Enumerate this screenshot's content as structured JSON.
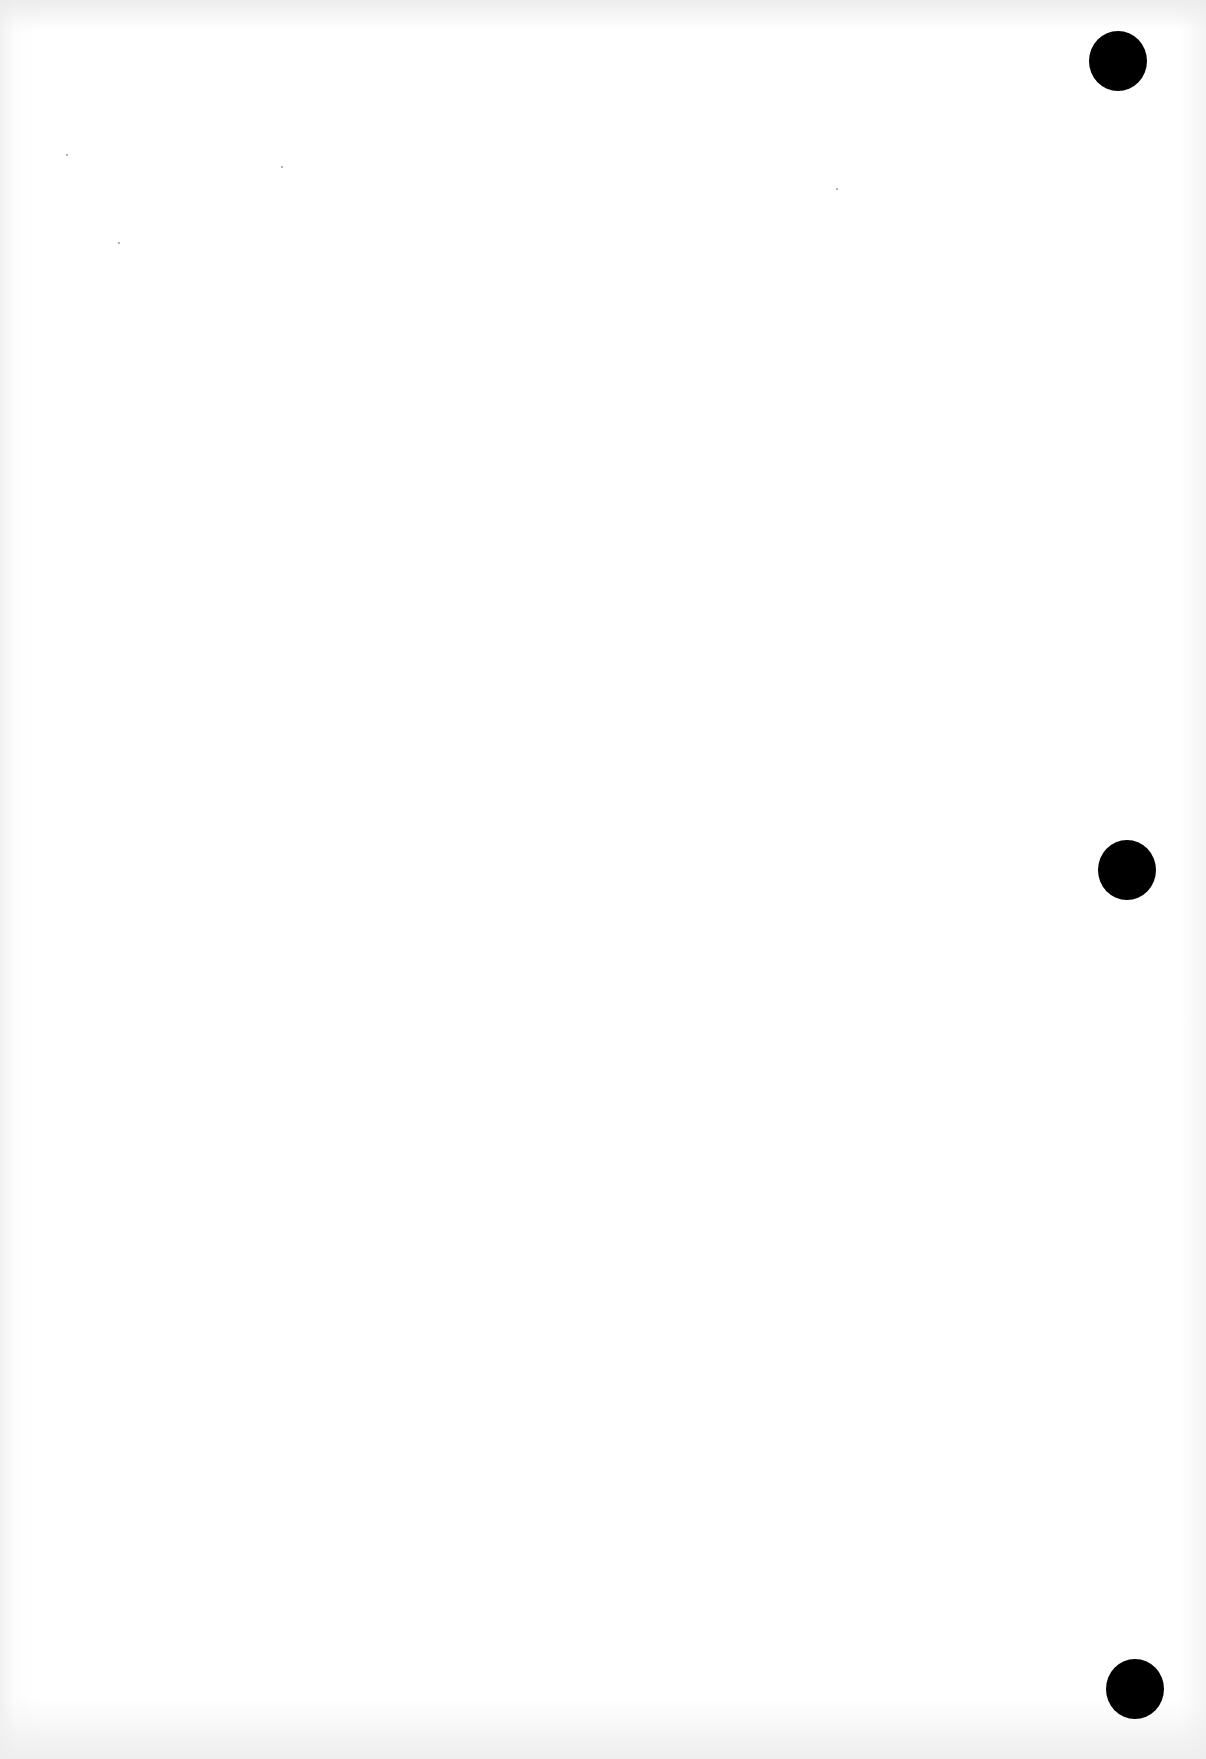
{
  "page": {
    "type": "blank scanned page",
    "background_color": "#ffffff",
    "text_content": ""
  },
  "punch_holes": [
    {
      "label": "top",
      "cx": 1118,
      "cy": 61,
      "rx": 29,
      "ry": 30,
      "color": "#000000"
    },
    {
      "label": "middle",
      "cx": 1127,
      "cy": 870,
      "rx": 29,
      "ry": 30,
      "color": "#000000"
    },
    {
      "label": "bottom",
      "cx": 1135,
      "cy": 1689,
      "rx": 29,
      "ry": 30,
      "color": "#000000"
    }
  ]
}
